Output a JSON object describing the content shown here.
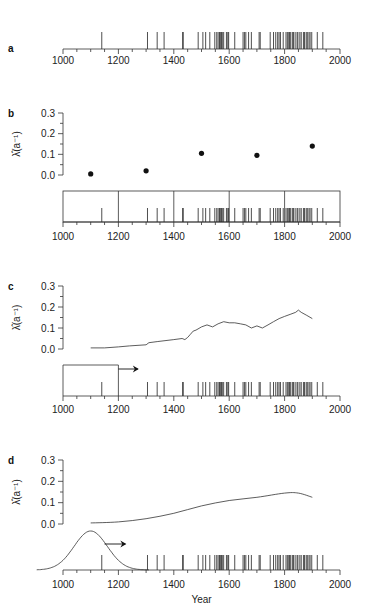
{
  "figure": {
    "x_axis": {
      "label": "Year",
      "ticks": [
        "1000",
        "1200",
        "1400",
        "1600",
        "1800",
        "2000"
      ],
      "range": [
        1000,
        2000
      ]
    },
    "y_axis": {
      "label": "λ̂(a⁻¹)",
      "ticks": [
        "0.0",
        "0.1",
        "0.2",
        "0.3"
      ],
      "range": [
        0,
        0.3
      ]
    },
    "panels": [
      {
        "id": "a",
        "label": "a"
      },
      {
        "id": "b",
        "label": "b"
      },
      {
        "id": "c",
        "label": "c"
      },
      {
        "id": "d",
        "label": "d"
      }
    ]
  },
  "chart_data": [
    {
      "type": "table",
      "panel": "a",
      "title": "Event record (rug plot)",
      "xlabel": "",
      "xlim": [
        1000,
        2000
      ],
      "events": [
        1140,
        1305,
        1340,
        1365,
        1432,
        1434,
        1488,
        1505,
        1515,
        1530,
        1548,
        1555,
        1560,
        1565,
        1568,
        1572,
        1575,
        1580,
        1590,
        1595,
        1598,
        1620,
        1650,
        1655,
        1660,
        1670,
        1680,
        1708,
        1712,
        1748,
        1760,
        1768,
        1775,
        1780,
        1785,
        1795,
        1805,
        1810,
        1815,
        1818,
        1822,
        1828,
        1832,
        1838,
        1845,
        1848,
        1855,
        1860,
        1868,
        1872,
        1878,
        1882,
        1888,
        1892,
        1898,
        1918,
        1938
      ]
    },
    {
      "type": "scatter",
      "panel": "b",
      "title": "Binned rate estimate (200-yr bins)",
      "xlabel": "",
      "ylabel": "λ̂(a⁻¹)",
      "ylim": [
        0,
        0.3
      ],
      "bins": [
        1000,
        1200,
        1400,
        1600,
        1800,
        2000
      ],
      "x": [
        1100,
        1300,
        1500,
        1700,
        1900
      ],
      "y": [
        0.005,
        0.02,
        0.105,
        0.095,
        0.14
      ]
    },
    {
      "type": "line",
      "panel": "c",
      "title": "Running-window rate estimate (200-yr window)",
      "xlabel": "",
      "ylabel": "λ̂(a⁻¹)",
      "ylim": [
        0,
        0.3
      ],
      "window": 200,
      "x": [
        1100,
        1150,
        1200,
        1240,
        1300,
        1310,
        1340,
        1400,
        1430,
        1440,
        1450,
        1460,
        1470,
        1480,
        1500,
        1520,
        1540,
        1560,
        1580,
        1600,
        1620,
        1640,
        1660,
        1680,
        1700,
        1720,
        1740,
        1760,
        1780,
        1800,
        1820,
        1840,
        1850,
        1860,
        1880,
        1900
      ],
      "y": [
        0.005,
        0.005,
        0.01,
        0.015,
        0.02,
        0.03,
        0.035,
        0.045,
        0.05,
        0.045,
        0.055,
        0.07,
        0.085,
        0.09,
        0.105,
        0.115,
        0.105,
        0.12,
        0.13,
        0.125,
        0.125,
        0.12,
        0.115,
        0.1,
        0.11,
        0.1,
        0.115,
        0.13,
        0.145,
        0.155,
        0.165,
        0.175,
        0.185,
        0.175,
        0.16,
        0.145
      ]
    },
    {
      "type": "line",
      "panel": "d",
      "title": "Kernel rate estimate (Gaussian kernel)",
      "xlabel": "Year",
      "ylabel": "λ̂(a⁻¹)",
      "ylim": [
        0,
        0.3
      ],
      "kernel": {
        "shape": "gaussian",
        "center": 1100,
        "approx_sd": 60
      },
      "x": [
        1100,
        1200,
        1300,
        1400,
        1500,
        1600,
        1700,
        1800,
        1850,
        1900
      ],
      "y": [
        0.005,
        0.01,
        0.025,
        0.05,
        0.085,
        0.11,
        0.125,
        0.145,
        0.145,
        0.125
      ]
    }
  ]
}
